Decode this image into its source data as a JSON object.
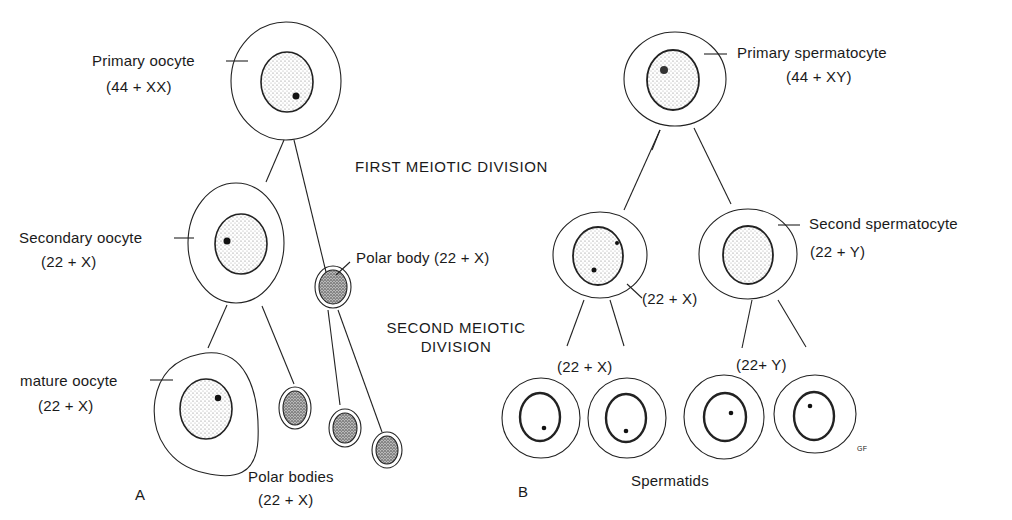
{
  "headings": {
    "first_meiotic": "FIRST MEIOTIC DIVISION",
    "second_meiotic_line1": "SECOND MEIOTIC",
    "second_meiotic_line2": "DIVISION"
  },
  "panel_a": {
    "letter": "A",
    "primary_oocyte": {
      "name": "Primary oocyte",
      "karyotype": "(44 + XX)"
    },
    "secondary_oocyte": {
      "name": "Secondary oocyte",
      "karyotype": "(22 + X)"
    },
    "polar_body": {
      "label": "Polar body (22 + X)"
    },
    "mature_oocyte": {
      "name": "mature oocyte",
      "karyotype": "(22 + X)"
    },
    "polar_bodies": {
      "name": "Polar bodies",
      "karyotype": "(22 + X)"
    }
  },
  "panel_b": {
    "letter": "B",
    "primary_spermatocyte": {
      "name": "Primary spermatocyte",
      "karyotype": "(44 + XY)"
    },
    "second_spermatocyte": {
      "name": "Second spermatocyte",
      "karyotype": "(22 + Y)"
    },
    "left_secondary_karyotype": "(22 + X)",
    "spermatid_x_karyotype": "(22 + X)",
    "spermatid_y_karyotype": "(22+ Y)",
    "spermatids": "Spermatids",
    "signature": "GF"
  },
  "colors": {
    "ink": "#1a1a1a",
    "background": "#ffffff",
    "stipple": "#777777"
  }
}
